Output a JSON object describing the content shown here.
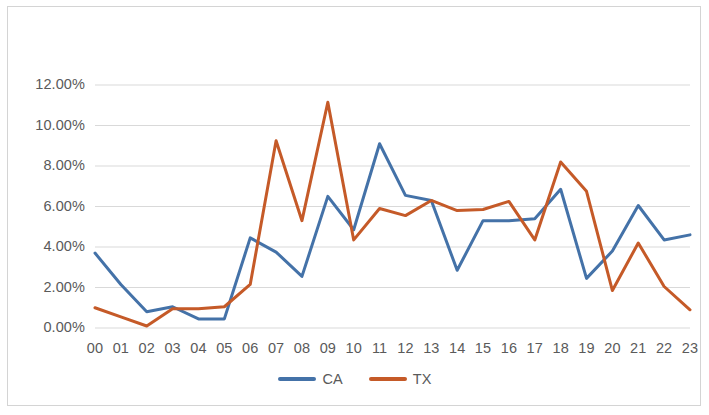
{
  "chart_data": {
    "type": "line",
    "title": "",
    "xlabel": "",
    "ylabel": "",
    "categories": [
      "00",
      "01",
      "02",
      "03",
      "04",
      "05",
      "06",
      "07",
      "08",
      "09",
      "10",
      "11",
      "12",
      "13",
      "14",
      "15",
      "16",
      "17",
      "18",
      "19",
      "20",
      "21",
      "22",
      "23"
    ],
    "series": [
      {
        "name": "CA",
        "color": "#4472a8",
        "values": [
          3.7,
          2.15,
          0.8,
          1.05,
          0.45,
          0.45,
          4.45,
          3.75,
          2.55,
          6.5,
          4.85,
          9.1,
          6.55,
          6.3,
          2.85,
          5.3,
          5.3,
          5.4,
          6.85,
          2.45,
          3.8,
          6.05,
          4.35,
          4.6
        ]
      },
      {
        "name": "TX",
        "color": "#c55a28",
        "values": [
          1.0,
          0.55,
          0.1,
          0.95,
          0.95,
          1.05,
          2.15,
          9.25,
          5.3,
          11.15,
          4.35,
          5.9,
          5.55,
          6.3,
          5.8,
          5.85,
          6.25,
          4.35,
          8.2,
          6.75,
          1.85,
          4.2,
          2.05,
          0.9
        ]
      }
    ],
    "ylim": [
      0,
      12
    ],
    "yticks": [
      0,
      2,
      4,
      6,
      8,
      10,
      12
    ],
    "ytick_labels": [
      "0.00%",
      "2.00%",
      "4.00%",
      "6.00%",
      "8.00%",
      "10.00%",
      "12.00%"
    ],
    "grid": true,
    "grid_color": "#d9d9d9",
    "legend_position": "bottom",
    "border_color": "#d4d4d4"
  },
  "legend": {
    "items": [
      {
        "label": "CA"
      },
      {
        "label": "TX"
      }
    ]
  }
}
